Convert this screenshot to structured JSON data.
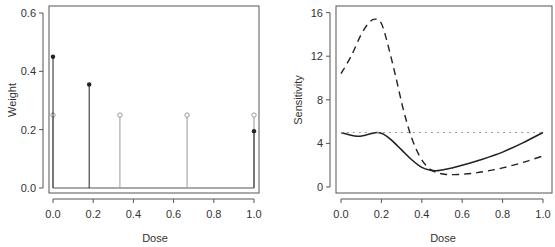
{
  "chart_data": [
    {
      "type": "scatter",
      "subtype": "stem",
      "title": "",
      "xlabel": "Dose",
      "ylabel": "Weight",
      "xlim": [
        0,
        1
      ],
      "ylim": [
        0,
        0.6
      ],
      "xticks": [
        "0.0",
        "0.2",
        "0.4",
        "0.6",
        "0.8",
        "1.0"
      ],
      "yticks": [
        "0.0",
        "0.2",
        "0.4",
        "0.6"
      ],
      "grid": false,
      "series": [
        {
          "name": "Design A (filled points)",
          "marker": "filled-circle",
          "color": "#222222",
          "x": [
            0.0,
            0.18,
            1.0
          ],
          "y": [
            0.45,
            0.355,
            0.195
          ]
        },
        {
          "name": "Design B (open points)",
          "marker": "open-circle",
          "color": "#999999",
          "x": [
            0.0,
            0.333,
            0.667,
            1.0
          ],
          "y": [
            0.25,
            0.25,
            0.25,
            0.25
          ]
        }
      ]
    },
    {
      "type": "line",
      "title": "",
      "xlabel": "Dose",
      "ylabel": "Sensitivity",
      "xlim": [
        0,
        1
      ],
      "ylim": [
        0,
        16
      ],
      "xticks": [
        "0.0",
        "0.2",
        "0.4",
        "0.6",
        "0.8",
        "1.0"
      ],
      "yticks": [
        "0",
        "4",
        "8",
        "12",
        "16"
      ],
      "grid": false,
      "series": [
        {
          "name": "Solid curve",
          "style": "solid",
          "color": "#222222",
          "x": [
            0.0,
            0.04,
            0.08,
            0.12,
            0.15,
            0.18,
            0.21,
            0.25,
            0.3,
            0.35,
            0.4,
            0.44,
            0.48,
            0.55,
            0.6,
            0.7,
            0.8,
            0.9,
            1.0
          ],
          "y": [
            5.0,
            4.8,
            4.65,
            4.75,
            4.9,
            5.0,
            4.85,
            4.3,
            3.4,
            2.5,
            1.8,
            1.55,
            1.5,
            1.75,
            2.0,
            2.55,
            3.2,
            4.05,
            5.0
          ]
        },
        {
          "name": "Dashed curve",
          "style": "dashed",
          "color": "#222222",
          "x": [
            0.0,
            0.05,
            0.1,
            0.14,
            0.17,
            0.2,
            0.23,
            0.27,
            0.31,
            0.35,
            0.39,
            0.43,
            0.47,
            0.52,
            0.58,
            0.65,
            0.72,
            0.8,
            0.9,
            1.0
          ],
          "y": [
            10.4,
            12.0,
            14.0,
            15.1,
            15.4,
            15.0,
            13.2,
            10.2,
            7.0,
            4.5,
            2.8,
            1.8,
            1.35,
            1.15,
            1.15,
            1.25,
            1.45,
            1.75,
            2.25,
            2.85
          ]
        },
        {
          "name": "Reference line",
          "style": "dotted",
          "color": "#999999",
          "x": [
            0.0,
            1.0
          ],
          "y": [
            5.0,
            5.0
          ]
        }
      ]
    }
  ]
}
